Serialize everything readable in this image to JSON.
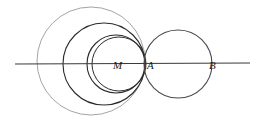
{
  "figure": {
    "width": 260,
    "height": 122,
    "background": "#ffffff",
    "stroke_dark": "#2b2b2b",
    "stroke_mid": "#4a4a4a",
    "stroke_light": "#9a9a9a",
    "label_color": "#1a1a1a"
  },
  "axis": {
    "name": "horizontal-line",
    "x1": 15,
    "y1": 64,
    "x2": 250,
    "y2": 63,
    "color": "#3a3a3a",
    "width": 1.1
  },
  "points": [
    {
      "id": "M",
      "label": "M",
      "x": 118,
      "y": 64,
      "label_x": 113,
      "label_y": 66
    },
    {
      "id": "A",
      "label": "A",
      "x": 145,
      "y": 64,
      "label_x": 147,
      "label_y": 66
    },
    {
      "id": "B",
      "label": "B",
      "x": 212,
      "y": 64,
      "label_x": 209,
      "label_y": 66
    }
  ],
  "circles": [
    {
      "id": "c-outer-light",
      "name": "outermost-circle",
      "cx": 91,
      "cy": 61,
      "r": 54,
      "stroke": "#9a9a9a",
      "width": 0.9
    },
    {
      "id": "c-second-dark",
      "name": "second-circle",
      "cx": 104,
      "cy": 64,
      "r": 41,
      "stroke": "#2b2b2b",
      "width": 1.1
    },
    {
      "id": "c-third",
      "name": "third-circle",
      "cx": 116,
      "cy": 64,
      "r": 29,
      "stroke": "#2b2b2b",
      "width": 1.1
    },
    {
      "id": "c-fourth",
      "name": "fourth-circle",
      "cx": 119,
      "cy": 64,
      "r": 27,
      "stroke": "#2b2b2b",
      "width": 1.0
    },
    {
      "id": "c-right",
      "name": "right-circle",
      "cx": 178,
      "cy": 64,
      "r": 34,
      "stroke": "#4a4a4a",
      "width": 1.1
    }
  ],
  "caption": {
    "alt": "Geometric diagram: a horizontal line with collinear points M, A and B; four mutually tangent circles on the left meeting at A, and one circle on the right from A to B."
  }
}
